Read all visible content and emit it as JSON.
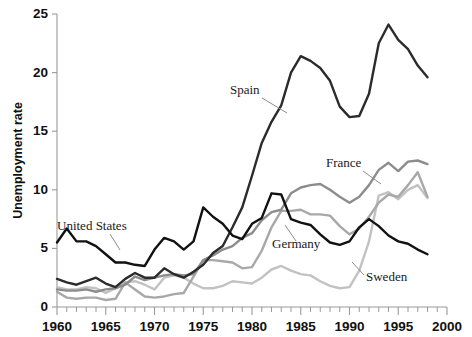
{
  "figure": {
    "title": "",
    "background": "#ffffff"
  },
  "axes": {
    "y_title": "Unemployment rate",
    "y_ticks": [
      "0",
      "5",
      "10",
      "15",
      "20",
      "25"
    ],
    "x_ticks": [
      "1960",
      "1965",
      "1970",
      "1975",
      "1980",
      "1985",
      "1990",
      "1995",
      "2000"
    ]
  },
  "annotations": {
    "spain": "Spain",
    "france": "France",
    "germany": "Germany",
    "sweden": "Sweden",
    "united_states": "United States"
  },
  "colors": {
    "spain": "#2b2b2b",
    "united_states": "#111111",
    "france": "#8c8c8c",
    "germany": "#a8a8a8",
    "sweden": "#c2c2c2",
    "axis": "#9a9a9a",
    "text": "#111111"
  },
  "chart_data": {
    "type": "line",
    "title": "",
    "xlabel": "",
    "ylabel": "Unemployment rate",
    "xlim": [
      1960,
      2000
    ],
    "ylim": [
      0,
      25
    ],
    "ytick_values": [
      0,
      5,
      10,
      15,
      20,
      25
    ],
    "xtick_values": [
      1960,
      1965,
      1970,
      1975,
      1980,
      1985,
      1990,
      1995,
      2000
    ],
    "minor_x_tick_interval": 1,
    "grid": false,
    "legend": "inline-annotations",
    "x": [
      1960,
      1961,
      1962,
      1963,
      1964,
      1965,
      1966,
      1967,
      1968,
      1969,
      1970,
      1971,
      1972,
      1973,
      1974,
      1975,
      1976,
      1977,
      1978,
      1979,
      1980,
      1981,
      1982,
      1983,
      1984,
      1985,
      1986,
      1987,
      1988,
      1989,
      1990,
      1991,
      1992,
      1993,
      1994,
      1995,
      1996,
      1997,
      1998
    ],
    "series": [
      {
        "name": "Spain",
        "color": "#2b2b2b",
        "values": [
          2.4,
          2.1,
          1.9,
          2.2,
          2.5,
          2.0,
          1.7,
          2.4,
          2.9,
          2.5,
          2.5,
          3.3,
          2.8,
          2.5,
          3.0,
          3.6,
          4.6,
          5.2,
          6.8,
          8.5,
          11.2,
          14.0,
          15.8,
          17.2,
          20.0,
          21.4,
          21.0,
          20.4,
          19.3,
          17.1,
          16.2,
          16.3,
          18.2,
          22.5,
          24.1,
          22.8,
          22.0,
          20.6,
          19.6
        ]
      },
      {
        "name": "United States",
        "color": "#111111",
        "values": [
          5.5,
          6.7,
          5.6,
          5.6,
          5.2,
          4.5,
          3.8,
          3.8,
          3.6,
          3.5,
          4.9,
          5.9,
          5.6,
          4.9,
          5.6,
          8.5,
          7.7,
          7.1,
          6.1,
          5.8,
          7.1,
          7.6,
          9.7,
          9.6,
          7.5,
          7.2,
          7.0,
          6.2,
          5.5,
          5.3,
          5.6,
          6.8,
          7.5,
          6.9,
          6.1,
          5.6,
          5.4,
          4.9,
          4.5
        ]
      },
      {
        "name": "France",
        "color": "#8c8c8c",
        "values": [
          1.5,
          1.4,
          1.4,
          1.5,
          1.3,
          1.5,
          1.6,
          1.9,
          2.6,
          2.3,
          2.5,
          2.7,
          2.8,
          2.7,
          2.8,
          4.0,
          4.4,
          4.9,
          5.2,
          5.9,
          6.3,
          7.4,
          8.1,
          8.3,
          9.7,
          10.2,
          10.4,
          10.5,
          10.0,
          9.4,
          8.9,
          9.4,
          10.4,
          11.7,
          12.3,
          11.6,
          12.4,
          12.5,
          12.2
        ]
      },
      {
        "name": "Germany",
        "color": "#a8a8a8",
        "values": [
          1.3,
          0.8,
          0.7,
          0.8,
          0.8,
          0.6,
          0.7,
          2.1,
          1.5,
          0.9,
          0.8,
          0.9,
          1.1,
          1.2,
          2.6,
          4.0,
          4.0,
          3.9,
          3.8,
          3.3,
          3.4,
          4.8,
          6.8,
          8.2,
          8.2,
          8.3,
          7.9,
          7.9,
          7.8,
          6.9,
          6.2,
          6.7,
          7.7,
          8.9,
          9.6,
          9.4,
          10.4,
          11.5,
          9.4
        ]
      },
      {
        "name": "Sweden",
        "color": "#c2c2c2",
        "values": [
          1.7,
          1.5,
          1.5,
          1.7,
          1.6,
          1.2,
          1.6,
          2.1,
          2.2,
          1.9,
          1.5,
          2.5,
          2.7,
          2.5,
          2.0,
          1.6,
          1.6,
          1.8,
          2.2,
          2.1,
          2.0,
          2.5,
          3.2,
          3.5,
          3.1,
          2.8,
          2.7,
          2.2,
          1.8,
          1.6,
          1.7,
          3.1,
          5.6,
          9.5,
          9.8,
          9.2,
          10.0,
          10.4,
          9.3
        ]
      }
    ]
  }
}
